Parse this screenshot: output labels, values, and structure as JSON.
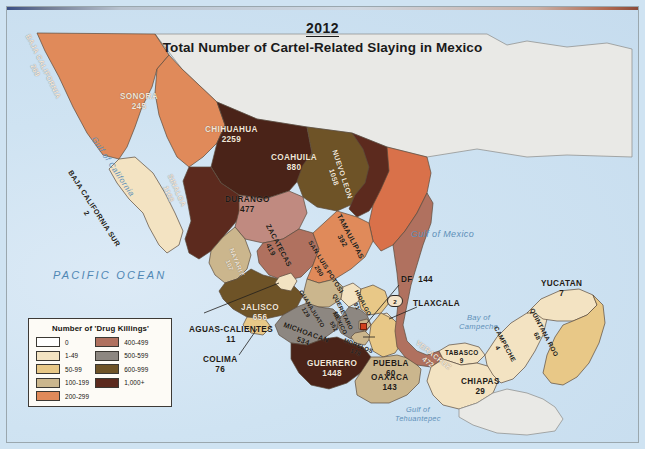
{
  "title": {
    "year": "2012",
    "main": "Total Number of Cartel-Related Slaying in Mexico"
  },
  "legend": {
    "title": "Number of 'Drug Killings'",
    "left_column": [
      {
        "label": "0",
        "color": "#ffffff"
      },
      {
        "label": "1-49",
        "color": "#f3e3c2"
      },
      {
        "label": "50-99",
        "color": "#e8c887"
      },
      {
        "label": "100-199",
        "color": "#cbb68d"
      },
      {
        "label": "200-299",
        "color": "#e08a5a"
      }
    ],
    "right_column": [
      {
        "label": "400-499",
        "color": "#b0715f"
      },
      {
        "label": "500-599",
        "color": "#8d8781"
      },
      {
        "label": "600-999",
        "color": "#6e5327"
      },
      {
        "label": "1,000+",
        "color": "#5c2a1e"
      }
    ]
  },
  "water_labels": {
    "pacific_ocean": "PACIFIC OCEAN",
    "gulf_of_california": "Gulf of California",
    "gulf_of_mexico": "Gulf of Mexico",
    "bay_of_campeche": "Bay of Campeche",
    "gulf_of_tehuantepec": "Gulf of Tehuantepec"
  },
  "states": [
    {
      "id": "baja-california",
      "name": "BAJA CALIFORNIA",
      "value": "269",
      "color": "#e08a5a"
    },
    {
      "id": "baja-california-sur",
      "name": "BAJA CALIFORNIA SUR",
      "value": "2",
      "color": "#f3e3c2"
    },
    {
      "id": "sonora",
      "name": "SONORA",
      "value": "245",
      "color": "#e08a5a"
    },
    {
      "id": "chihuahua",
      "name": "CHIHUAHUA",
      "value": "2259",
      "color": "#4a2318"
    },
    {
      "id": "coahuila",
      "name": "COAHUILA",
      "value": "880",
      "color": "#6e5327"
    },
    {
      "id": "nuevo-leon",
      "name": "NUEVO LEON",
      "value": "1058",
      "color": "#5c2a1e"
    },
    {
      "id": "tamaulipas",
      "name": "TAMAULIPAS",
      "value": "392",
      "color": "#d9714a"
    },
    {
      "id": "sinaloa",
      "name": "SINALOA",
      "value": "1168",
      "color": "#5c2a1e"
    },
    {
      "id": "durango",
      "name": "DURANGO",
      "value": "477",
      "color": "#c08a80"
    },
    {
      "id": "zacatecas",
      "name": "ZACATECAS",
      "value": "419",
      "color": "#b0715f"
    },
    {
      "id": "san-luis-potosi",
      "name": "SAN LUIS POTOSI",
      "value": "290",
      "color": "#e08a5a"
    },
    {
      "id": "nayarit",
      "name": "NAYARIT",
      "value": "107",
      "color": "#cbb68d"
    },
    {
      "id": "jalisco",
      "name": "JALISCO",
      "value": "656",
      "color": "#6e5327"
    },
    {
      "id": "aguascalientes",
      "name": "AGUAS-CALIENTES",
      "value": "11",
      "color": "#f3e3c2"
    },
    {
      "id": "colima",
      "name": "COLIMA",
      "value": "76",
      "color": "#e8c887"
    },
    {
      "id": "guanajuato",
      "name": "GUANAJUATO",
      "value": "129",
      "color": "#cbb68d"
    },
    {
      "id": "queretaro",
      "name": "QUERETARO",
      "value": "13",
      "color": "#f3e3c2"
    },
    {
      "id": "hidalgo",
      "name": "HIDALGO",
      "value": "91",
      "color": "#e8c887"
    },
    {
      "id": "michoacan",
      "name": "MICHOACAN",
      "value": "534",
      "color": "#8d8781"
    },
    {
      "id": "mexico",
      "name": "MEXICO",
      "value": "552",
      "color": "#8d8781"
    },
    {
      "id": "morelos",
      "name": "MORELOS",
      "value": "178",
      "color": "#cbb68d"
    },
    {
      "id": "df",
      "name": "DF",
      "value": "144",
      "color": "#cbb68d"
    },
    {
      "id": "tlaxcala",
      "name": "TLAXCALA",
      "value": "2",
      "color": "#f3e3c2"
    },
    {
      "id": "puebla",
      "name": "PUEBLA",
      "value": "60",
      "color": "#e8c887"
    },
    {
      "id": "guerrero",
      "name": "GUERRERO",
      "value": "1448",
      "color": "#4a2318"
    },
    {
      "id": "oaxaca",
      "name": "OAXACA",
      "value": "143",
      "color": "#cbb68d"
    },
    {
      "id": "veracruz",
      "name": "VERACRUZ",
      "value": "472",
      "color": "#b0715f"
    },
    {
      "id": "tabasco",
      "name": "TABASCO",
      "value": "9",
      "color": "#f3e3c2"
    },
    {
      "id": "chiapas",
      "name": "CHIAPAS",
      "value": "29",
      "color": "#f3e3c2"
    },
    {
      "id": "campeche",
      "name": "CAMPECHE",
      "value": "4",
      "color": "#f3e3c2"
    },
    {
      "id": "yucatan",
      "name": "YUCATAN",
      "value": "7",
      "color": "#f3e3c2"
    },
    {
      "id": "quintana-roo",
      "name": "QUINTANA ROO",
      "value": "68",
      "color": "#e8c887"
    }
  ]
}
